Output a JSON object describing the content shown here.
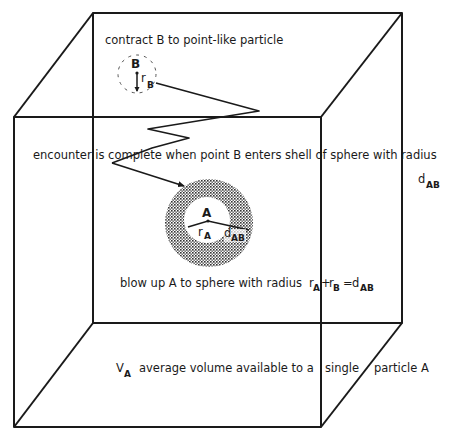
{
  "diagram": {
    "labels": {
      "contract": "contract B to point-like particle",
      "particle_b": "B",
      "radius_b_r": "r",
      "radius_b_sub": "B",
      "encounter": "encounter is complete when point B enters shell of sphere with radius",
      "dab_d": "d",
      "dab_sub": "AB",
      "particle_a": "A",
      "radius_a_r": "r",
      "radius_a_sub": "A",
      "inner_d": "d",
      "inner_sub": "AB",
      "blowup": "blow up A to sphere with radius",
      "eq_ra_r": "r",
      "eq_ra_sub": "A",
      "eq_plus": "+",
      "eq_rb_r": "r",
      "eq_rb_sub": "B",
      "eq_equals": "=",
      "eq_d": "d",
      "eq_d_sub": "AB",
      "volume_v": "V",
      "volume_sub": "A",
      "volume_text_1": "average volume available to a",
      "volume_text_2": "single",
      "volume_text_3": "particle A"
    },
    "colors": {
      "ink": "#1a1a1a",
      "shell_fill": "#8a8a8a",
      "background": "#ffffff"
    }
  }
}
